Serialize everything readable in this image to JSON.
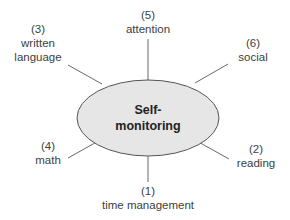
{
  "diagram": {
    "center": {
      "line1": "Self-",
      "line2": "monitoring",
      "fill": "#e6e6e6",
      "stroke": "#555555"
    },
    "nodes": [
      {
        "number": "(1)",
        "label": "time management"
      },
      {
        "number": "(2)",
        "label": "reading"
      },
      {
        "number": "(3)",
        "label_line1": "written",
        "label_line2": "language"
      },
      {
        "number": "(4)",
        "label": "math"
      },
      {
        "number": "(5)",
        "label": "attention"
      },
      {
        "number": "(6)",
        "label": "social"
      }
    ]
  }
}
